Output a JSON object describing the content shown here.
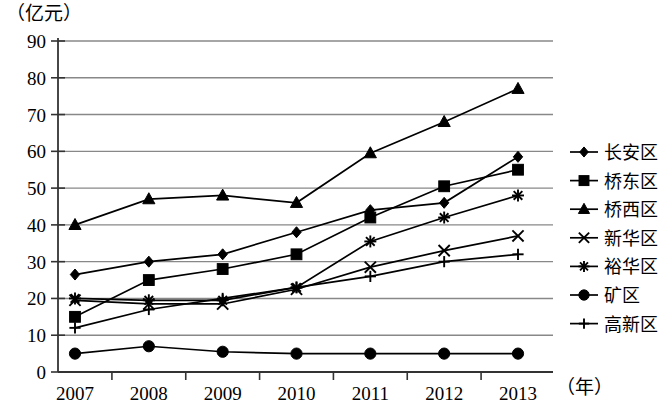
{
  "chart_data": {
    "type": "line",
    "title": "",
    "xlabel": "（年）",
    "ylabel": "（亿元）",
    "categories": [
      "2007",
      "2008",
      "2009",
      "2010",
      "2011",
      "2012",
      "2013"
    ],
    "x": [
      2007,
      2008,
      2009,
      2010,
      2011,
      2012,
      2013
    ],
    "ylim": [
      0,
      90
    ],
    "yticks": [
      0,
      10,
      20,
      30,
      40,
      50,
      60,
      70,
      80,
      90
    ],
    "grid": true,
    "legend_position": "right",
    "series": [
      {
        "name": "长安区",
        "marker": "diamond",
        "values": [
          26.5,
          30,
          32,
          38,
          44,
          46,
          58.5
        ]
      },
      {
        "name": "桥东区",
        "marker": "square",
        "values": [
          15,
          25,
          28,
          32,
          42,
          50.5,
          55
        ]
      },
      {
        "name": "桥西区",
        "marker": "triangle",
        "values": [
          40,
          47,
          48,
          46,
          59.5,
          68,
          77
        ]
      },
      {
        "name": "新华区",
        "marker": "x",
        "values": [
          19.5,
          18.5,
          18.5,
          22.5,
          28.5,
          33,
          37
        ]
      },
      {
        "name": "裕华区",
        "marker": "asterisk",
        "values": [
          20,
          19.5,
          19.5,
          23,
          35.5,
          42,
          48
        ]
      },
      {
        "name": "矿区",
        "marker": "circle",
        "values": [
          5,
          7,
          5.5,
          5,
          5,
          5,
          5
        ]
      },
      {
        "name": "高新区",
        "marker": "plus",
        "values": [
          12,
          17,
          20,
          23,
          26,
          30,
          32
        ]
      }
    ]
  },
  "axis": {
    "y_unit": "（亿元）",
    "x_unit": "（年）"
  },
  "colors": {
    "ink": "#000000",
    "grid": "#888888",
    "background": "#ffffff"
  }
}
